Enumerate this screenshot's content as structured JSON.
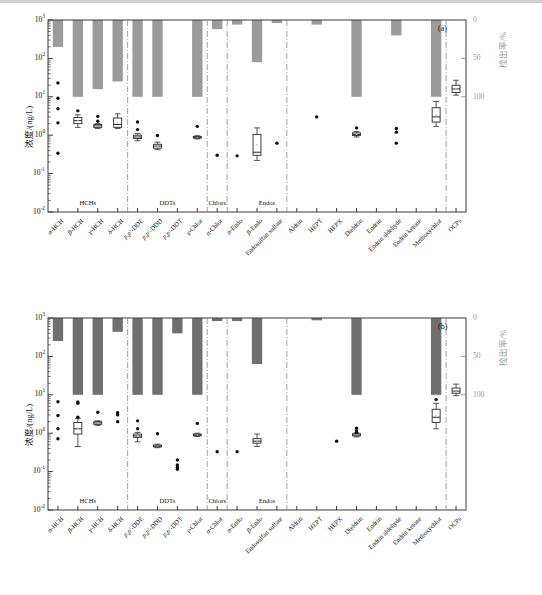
{
  "figure": {
    "width": 542,
    "height": 595,
    "background": "#ffffff"
  },
  "chart_data": {
    "type": "bar",
    "title": "",
    "categories": [
      "α-HCH",
      "β-HCH",
      "γ-HCH",
      "δ-HCH",
      "p,p'-DDE",
      "p,p'-DDD",
      "p,p'-DDT",
      "γ-Chlor",
      "α-Chlor",
      "α-Endo",
      "β-Endo",
      "Endosulfan sulfate",
      "Aldrin",
      "HEPT",
      "HEPX",
      "Dieldrin",
      "Endrin",
      "Endrin aldehyde",
      "Endrin ketone",
      "Methoxychlor",
      "OCPs"
    ],
    "xlabel": "",
    "ylabel_left": "浓度/(ng/L)",
    "ylabel_right": "检出率/%",
    "y_left_ticks": [
      "10³",
      "10²",
      "10¹",
      "10⁰",
      "10⁻¹",
      "10⁻²"
    ],
    "y_left_exponents": [
      3,
      2,
      1,
      0,
      -1,
      -2
    ],
    "ylim_left": [
      0.01,
      1000
    ],
    "y_right_ticks": [
      "0",
      "50",
      "100"
    ],
    "ylim_right": [
      0,
      100
    ],
    "y_right_inverted": true,
    "grid": false,
    "legend": "none",
    "group_separators_after": [
      "δ-HCH",
      "γ-Chlor",
      "α-Chlor",
      "Endosulfan sulfate",
      "Methoxychlor"
    ],
    "group_labels": [
      {
        "label": "HCHs",
        "span": [
          "α-HCH",
          "δ-HCH"
        ]
      },
      {
        "label": "DDTs",
        "span": [
          "p,p'-DDE",
          "γ-Chlor"
        ]
      },
      {
        "label": "Chlors",
        "span": [
          "α-Chlor",
          "α-Chlor"
        ]
      },
      {
        "label": "Endos",
        "span": [
          "β-Endo",
          "Endosulfan sulfate"
        ]
      }
    ],
    "panels": [
      {
        "id": "a",
        "label": "(a)",
        "bar_color": "#9b9b9b",
        "bar_series_name": "检出率/%",
        "detection_rate": [
          35,
          100,
          90,
          80,
          100,
          100,
          0,
          100,
          12,
          6,
          55,
          4,
          0,
          6,
          0,
          100,
          0,
          20,
          0,
          100,
          0
        ],
        "box_series_name": "浓度/(ng/L)",
        "boxes": [
          {
            "cat": "α-HCH",
            "median": null,
            "q1": null,
            "q3": null,
            "whislo": null,
            "whishi": null,
            "points": [
              23.0,
              9.2,
              4.9,
              2.1,
              0.34
            ]
          },
          {
            "cat": "β-HCH",
            "median": 2.4,
            "q1": 2.0,
            "q3": 2.9,
            "whislo": 1.6,
            "whishi": 3.4,
            "points": [
              4.3
            ]
          },
          {
            "cat": "γ-HCH",
            "median": 1.75,
            "q1": 1.6,
            "q3": 1.9,
            "whislo": 1.5,
            "whishi": 2.0,
            "points": [
              3.1,
              2.3
            ]
          },
          {
            "cat": "δ-HCH",
            "median": 1.9,
            "q1": 1.6,
            "q3": 2.8,
            "whislo": 1.5,
            "whishi": 3.6,
            "points": []
          },
          {
            "cat": "p,p'-DDE",
            "median": 0.9,
            "q1": 0.82,
            "q3": 1.0,
            "whislo": 0.72,
            "whishi": 1.1,
            "points": [
              2.2,
              1.4
            ]
          },
          {
            "cat": "p,p'-DDD",
            "median": 0.52,
            "q1": 0.46,
            "q3": 0.58,
            "whislo": 0.42,
            "whishi": 0.66,
            "points": [
              0.98
            ]
          },
          {
            "cat": "p,p'-DDT",
            "median": null,
            "q1": null,
            "q3": null,
            "whislo": null,
            "whishi": null,
            "points": []
          },
          {
            "cat": "γ-Chlor",
            "median": 0.88,
            "q1": 0.84,
            "q3": 0.93,
            "whislo": 0.8,
            "whishi": 0.97,
            "points": [
              1.7
            ]
          },
          {
            "cat": "α-Chlor",
            "median": null,
            "q1": null,
            "q3": null,
            "whislo": null,
            "whishi": null,
            "points": [
              0.3
            ]
          },
          {
            "cat": "α-Endo",
            "median": null,
            "q1": null,
            "q3": null,
            "whislo": null,
            "whishi": null,
            "points": [
              0.29
            ]
          },
          {
            "cat": "β-Endo",
            "median": 0.36,
            "q1": 0.3,
            "q3": 1.05,
            "whislo": 0.22,
            "whishi": 1.55,
            "points": []
          },
          {
            "cat": "Endosulfan sulfate",
            "median": null,
            "q1": null,
            "q3": null,
            "whislo": null,
            "whishi": null,
            "points": [
              0.62
            ]
          },
          {
            "cat": "Aldrin",
            "median": null,
            "q1": null,
            "q3": null,
            "whislo": null,
            "whishi": null,
            "points": []
          },
          {
            "cat": "HEPT",
            "median": null,
            "q1": null,
            "q3": null,
            "whislo": null,
            "whishi": null,
            "points": [
              3.0
            ]
          },
          {
            "cat": "HEPX",
            "median": null,
            "q1": null,
            "q3": null,
            "whislo": null,
            "whishi": null,
            "points": []
          },
          {
            "cat": "Dieldrin",
            "median": 1.05,
            "q1": 0.98,
            "q3": 1.15,
            "whislo": 0.9,
            "whishi": 1.25,
            "points": [
              1.55
            ]
          },
          {
            "cat": "Endrin",
            "median": null,
            "q1": null,
            "q3": null,
            "whislo": null,
            "whishi": null,
            "points": []
          },
          {
            "cat": "Endrin aldehyde",
            "median": null,
            "q1": null,
            "q3": null,
            "whislo": null,
            "whishi": null,
            "points": [
              1.5,
              1.2,
              0.62
            ]
          },
          {
            "cat": "Endrin ketone",
            "median": null,
            "q1": null,
            "q3": null,
            "whislo": null,
            "whishi": null,
            "points": []
          },
          {
            "cat": "Methoxychlor",
            "median": 3.0,
            "q1": 2.2,
            "q3": 5.2,
            "whislo": 1.7,
            "whishi": 7.5,
            "points": []
          },
          {
            "cat": "OCPs",
            "median": 16.0,
            "q1": 13.0,
            "q3": 20.0,
            "whislo": 11.0,
            "whishi": 27.0,
            "points": []
          }
        ]
      },
      {
        "id": "b",
        "label": "(b)",
        "bar_color": "#6f6f6f",
        "bar_series_name": "检出率/%",
        "detection_rate": [
          30,
          100,
          100,
          18,
          100,
          100,
          20,
          100,
          4,
          4,
          60,
          0,
          0,
          3,
          0,
          100,
          0,
          0,
          0,
          100,
          0
        ],
        "box_series_name": "浓度/(ng/L)",
        "boxes": [
          {
            "cat": "α-HCH",
            "median": null,
            "q1": null,
            "q3": null,
            "whislo": null,
            "whishi": null,
            "points": [
              6.6,
              2.9,
              1.3,
              0.72
            ]
          },
          {
            "cat": "β-HCH",
            "median": 1.3,
            "q1": 0.95,
            "q3": 1.9,
            "whislo": 0.45,
            "whishi": 2.4,
            "points": [
              6.5,
              6.0,
              2.6
            ]
          },
          {
            "cat": "γ-HCH",
            "median": 1.85,
            "q1": 1.7,
            "q3": 2.0,
            "whislo": 1.6,
            "whishi": 2.1,
            "points": [
              3.5
            ]
          },
          {
            "cat": "δ-HCH",
            "median": null,
            "q1": null,
            "q3": null,
            "whislo": null,
            "whishi": null,
            "points": [
              3.4,
              3.0,
              2.0
            ]
          },
          {
            "cat": "p,p'-DDE",
            "median": 0.85,
            "q1": 0.78,
            "q3": 0.95,
            "whislo": 0.6,
            "whishi": 1.05,
            "points": [
              2.1,
              1.3
            ]
          },
          {
            "cat": "p,p'-DDD",
            "median": 0.46,
            "q1": 0.44,
            "q3": 0.49,
            "whislo": 0.42,
            "whishi": 0.52,
            "points": [
              0.97
            ]
          },
          {
            "cat": "p,p'-DDT",
            "median": null,
            "q1": null,
            "q3": null,
            "whislo": null,
            "whishi": null,
            "points": [
              0.2,
              0.15,
              0.13,
              0.115
            ]
          },
          {
            "cat": "γ-Chlor",
            "median": 0.9,
            "q1": 0.86,
            "q3": 0.95,
            "whislo": 0.82,
            "whishi": 1.0,
            "points": [
              1.8
            ]
          },
          {
            "cat": "α-Chlor",
            "median": null,
            "q1": null,
            "q3": null,
            "whislo": null,
            "whishi": null,
            "points": [
              0.33
            ]
          },
          {
            "cat": "α-Endo",
            "median": null,
            "q1": null,
            "q3": null,
            "whislo": null,
            "whishi": null,
            "points": [
              0.33
            ]
          },
          {
            "cat": "β-Endo",
            "median": 0.62,
            "q1": 0.55,
            "q3": 0.72,
            "whislo": 0.45,
            "whishi": 0.95,
            "points": []
          },
          {
            "cat": "Endosulfan sulfate",
            "median": null,
            "q1": null,
            "q3": null,
            "whislo": null,
            "whishi": null,
            "points": []
          },
          {
            "cat": "Aldrin",
            "median": null,
            "q1": null,
            "q3": null,
            "whislo": null,
            "whishi": null,
            "points": []
          },
          {
            "cat": "HEPT",
            "median": null,
            "q1": null,
            "q3": null,
            "whislo": null,
            "whishi": null,
            "points": []
          },
          {
            "cat": "HEPX",
            "median": null,
            "q1": null,
            "q3": null,
            "whislo": null,
            "whishi": null,
            "points": [
              0.62
            ]
          },
          {
            "cat": "Dieldrin",
            "median": 0.9,
            "q1": 0.85,
            "q3": 0.97,
            "whislo": 0.8,
            "whishi": 1.02,
            "points": [
              1.35,
              1.15,
              1.05
            ]
          },
          {
            "cat": "Endrin",
            "median": null,
            "q1": null,
            "q3": null,
            "whislo": null,
            "whishi": null,
            "points": []
          },
          {
            "cat": "Endrin aldehyde",
            "median": null,
            "q1": null,
            "q3": null,
            "whislo": null,
            "whishi": null,
            "points": []
          },
          {
            "cat": "Endrin ketone",
            "median": null,
            "q1": null,
            "q3": null,
            "whislo": null,
            "whishi": null,
            "points": []
          },
          {
            "cat": "Methoxychlor",
            "median": 2.6,
            "q1": 1.9,
            "q3": 4.2,
            "whislo": 1.3,
            "whishi": 6.0,
            "points": [
              7.5
            ]
          },
          {
            "cat": "OCPs",
            "median": 12.5,
            "q1": 11.0,
            "q3": 15.0,
            "whislo": 9.5,
            "whishi": 19.0,
            "points": []
          }
        ]
      }
    ]
  }
}
